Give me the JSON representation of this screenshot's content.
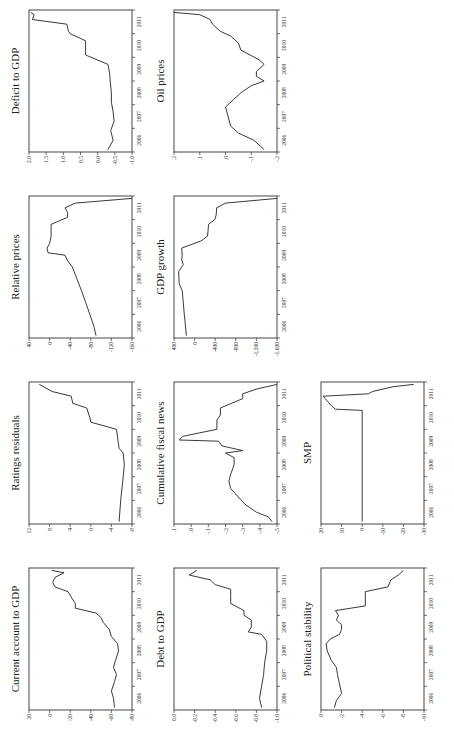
{
  "figure": {
    "orientation": "rotated 90 degrees counterclockwise",
    "x_tick_labels": [
      "2006",
      "2007",
      "2008",
      "2009",
      "2010",
      "2011"
    ]
  },
  "chart_data": [
    {
      "type": "line",
      "title": "Current account to GDP",
      "xlabel": "",
      "ylabel": "",
      "yticks": [
        "20",
        "0",
        "-20",
        "-40",
        "-60",
        "-80"
      ],
      "ylim": [
        -80,
        20
      ],
      "x": [
        2005.6,
        2006.0,
        2006.3,
        2006.7,
        2007.0,
        2007.3,
        2007.6,
        2008.0,
        2008.3,
        2008.6,
        2008.9,
        2009.2,
        2009.4,
        2009.6,
        2009.8,
        2010.0,
        2010.2,
        2010.5,
        2010.7,
        2010.9,
        2011.1,
        2011.3,
        2011.4
      ],
      "values": [
        -63,
        -62,
        -60,
        -63,
        -65,
        -62,
        -64,
        -67,
        -66,
        -60,
        -58,
        -52,
        -50,
        -45,
        -25,
        -25,
        -22,
        -18,
        -5,
        -3,
        -5,
        -14,
        -2
      ]
    },
    {
      "type": "line",
      "title": "Debt to GDP",
      "yticks": [
        "0.0",
        "-0.2",
        "-0.4",
        "-0.6",
        "-0.8",
        "-1.0"
      ],
      "ylim": [
        -1.0,
        0.0
      ],
      "x": [
        2005.6,
        2006.0,
        2006.5,
        2007.0,
        2007.5,
        2008.0,
        2008.4,
        2008.7,
        2008.8,
        2009.0,
        2009.3,
        2009.5,
        2009.7,
        2010.0,
        2010.3,
        2010.6,
        2010.8,
        2011.0,
        2011.2,
        2011.4
      ],
      "values": [
        -0.85,
        -0.83,
        -0.85,
        -0.87,
        -0.88,
        -0.9,
        -0.9,
        -0.85,
        -0.72,
        -0.75,
        -0.75,
        -0.68,
        -0.68,
        -0.55,
        -0.55,
        -0.55,
        -0.4,
        -0.35,
        -0.15,
        -0.22
      ]
    },
    {
      "type": "line",
      "title": "Political stability",
      "yticks": [
        "0",
        "-2",
        "-4",
        "-6",
        "-8",
        "-10"
      ],
      "ylim": [
        -10,
        0
      ],
      "x": [
        2005.6,
        2005.9,
        2006.2,
        2006.6,
        2007.0,
        2007.3,
        2007.6,
        2008.0,
        2008.3,
        2008.5,
        2008.7,
        2008.9,
        2009.1,
        2009.3,
        2009.5,
        2009.7,
        2009.9,
        2010.2,
        2010.5,
        2010.7,
        2011.0,
        2011.2,
        2011.4
      ],
      "values": [
        -1.3,
        -1.5,
        -2.0,
        -1.8,
        -1.6,
        -1.5,
        -1.0,
        -0.6,
        -0.5,
        -0.9,
        -1.8,
        -2.0,
        -2.0,
        -1.5,
        -1.7,
        -1.4,
        -4.3,
        -4.3,
        -4.3,
        -6.5,
        -6.8,
        -7.5,
        -8.0
      ]
    },
    {
      "type": "line",
      "title": "Ratings residuals",
      "yticks": [
        "12",
        "8",
        "4",
        "0",
        "-4",
        "-8"
      ],
      "ylim": [
        -8,
        12
      ],
      "x": [
        2005.6,
        2006.5,
        2007.5,
        2008.0,
        2008.5,
        2008.7,
        2009.0,
        2009.5,
        2009.8,
        2010.0,
        2010.4,
        2010.6,
        2010.9,
        2011.1,
        2011.4
      ],
      "values": [
        -5.5,
        -5.8,
        -6.3,
        -6.5,
        -6.3,
        -5.5,
        -5.3,
        -5.0,
        0.0,
        0.2,
        0.8,
        3.5,
        3.8,
        7.5,
        10
      ]
    },
    {
      "type": "line",
      "title": "Cumulative fiscal news",
      "yticks": [
        ".1",
        ".0",
        "-.1",
        "-.2",
        "-.3",
        "-.4",
        "-.5"
      ],
      "ylim": [
        -0.5,
        0.1
      ],
      "x": [
        2005.6,
        2005.8,
        2006.0,
        2006.3,
        2006.6,
        2007.0,
        2007.3,
        2007.6,
        2008.0,
        2008.3,
        2008.5,
        2008.6,
        2008.8,
        2009.0,
        2009.05,
        2009.2,
        2009.5,
        2009.9,
        2010.1,
        2010.4,
        2010.8,
        2011.0,
        2011.2,
        2011.4
      ],
      "values": [
        -0.47,
        -0.45,
        -0.38,
        -0.32,
        -0.28,
        -0.23,
        -0.22,
        -0.23,
        -0.25,
        -0.25,
        -0.2,
        -0.3,
        -0.18,
        -0.16,
        0.07,
        0.05,
        -0.15,
        -0.15,
        -0.17,
        -0.17,
        -0.3,
        -0.3,
        -0.38,
        -0.5
      ]
    },
    {
      "type": "line",
      "title": "SMP",
      "yticks": [
        "20",
        "10",
        "0",
        "-10",
        "-20",
        "-30"
      ],
      "ylim": [
        -30,
        20
      ],
      "x": [
        2005.6,
        2006.5,
        2007.5,
        2008.5,
        2009.5,
        2010.3,
        2010.35,
        2010.5,
        2010.7,
        2010.9,
        2011.0,
        2011.1,
        2011.3,
        2011.4
      ],
      "values": [
        0,
        0,
        0,
        0,
        0,
        0,
        13,
        15,
        17,
        19,
        -3,
        -5,
        -15,
        -25
      ]
    },
    {
      "type": "line",
      "title": "Relative prices",
      "yticks": [
        "40",
        "0",
        "-40",
        "-80",
        "-120",
        "-160"
      ],
      "ylim": [
        -160,
        40
      ],
      "x": [
        2005.6,
        2006.0,
        2006.5,
        2007.0,
        2007.5,
        2008.0,
        2008.5,
        2008.8,
        2009.0,
        2009.1,
        2009.3,
        2009.5,
        2009.8,
        2010.0,
        2010.3,
        2010.6,
        2010.8,
        2011.0,
        2011.2,
        2011.4
      ],
      "values": [
        -90,
        -86,
        -78,
        -70,
        -62,
        -53,
        -44,
        -34,
        -30,
        3,
        5,
        0,
        -3,
        -3,
        -3,
        -35,
        -35,
        -30,
        -50,
        -160
      ]
    },
    {
      "type": "line",
      "title": "GDP growth",
      "yticks": [
        "400",
        "0",
        "-400",
        "-800",
        "-1,200",
        "-1,600"
      ],
      "ylim": [
        -1600,
        400
      ],
      "x": [
        2005.6,
        2006.5,
        2007.5,
        2007.8,
        2008.3,
        2008.6,
        2008.8,
        2009.0,
        2009.3,
        2009.6,
        2009.8,
        2010.0,
        2010.3,
        2010.5,
        2010.7,
        2011.0,
        2011.2,
        2011.4
      ],
      "values": [
        160,
        200,
        240,
        300,
        310,
        220,
        250,
        240,
        250,
        -120,
        -250,
        -260,
        -270,
        -390,
        -420,
        -430,
        -600,
        -1600
      ]
    },
    {
      "type": "line",
      "title": "Deficit to GDP",
      "yticks": [
        "2.0",
        "1.5",
        "1.0",
        "0.5",
        "0.0",
        "-0.5",
        "-1.0"
      ],
      "ylim": [
        -1.0,
        2.0
      ],
      "x": [
        2005.6,
        2006.0,
        2006.4,
        2006.8,
        2007.2,
        2007.6,
        2008.0,
        2008.4,
        2008.8,
        2009.2,
        2009.6,
        2009.8,
        2010.2,
        2010.5,
        2010.6,
        2010.9,
        2011.1,
        2011.3,
        2011.4
      ],
      "values": [
        -0.3,
        -0.45,
        -0.38,
        -0.48,
        -0.45,
        -0.4,
        -0.4,
        -0.37,
        -0.35,
        -0.3,
        0.35,
        0.35,
        0.35,
        0.8,
        0.85,
        0.9,
        1.9,
        1.85,
        1.95
      ]
    },
    {
      "type": "line",
      "title": "Oil prices",
      "yticks": [
        ".2",
        ".1",
        ".0",
        "-.1",
        "-.2"
      ],
      "ylim": [
        -0.2,
        0.2
      ],
      "x": [
        2005.6,
        2005.8,
        2006.0,
        2006.3,
        2006.6,
        2007.0,
        2007.4,
        2007.7,
        2008.0,
        2008.3,
        2008.5,
        2008.7,
        2008.9,
        2009.2,
        2009.4,
        2009.8,
        2010.1,
        2010.4,
        2010.6,
        2010.9,
        2011.1,
        2011.3,
        2011.4
      ],
      "values": [
        -0.15,
        -0.13,
        -0.11,
        -0.05,
        -0.02,
        -0.01,
        0.0,
        -0.03,
        -0.06,
        -0.1,
        -0.15,
        -0.12,
        -0.12,
        -0.15,
        -0.13,
        -0.06,
        -0.05,
        -0.02,
        0.02,
        0.05,
        0.06,
        0.1,
        0.2
      ]
    }
  ]
}
